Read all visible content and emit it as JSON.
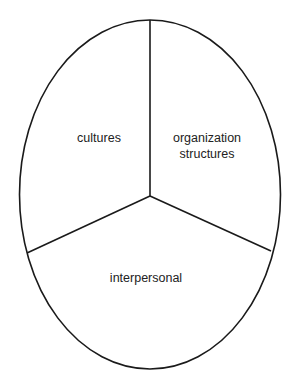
{
  "diagram": {
    "type": "ellipse divided into three sectors",
    "stroke_color": "#1a1a1a",
    "background": "#ffffff",
    "sectors": [
      {
        "id": "cultures",
        "label_lines": [
          "cultures"
        ],
        "position": "upper-left"
      },
      {
        "id": "organization-structures",
        "label_lines": [
          "organization",
          "structures"
        ],
        "position": "upper-right"
      },
      {
        "id": "interpersonal",
        "label_lines": [
          "interpersonal"
        ],
        "position": "bottom"
      }
    ]
  }
}
